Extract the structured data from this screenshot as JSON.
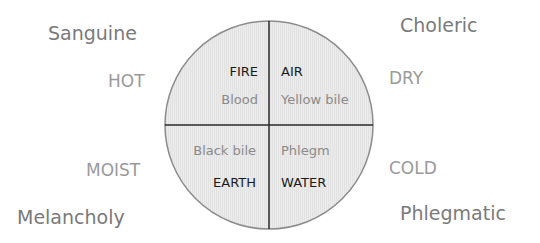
{
  "temperaments": {
    "top_left": "Sanguine",
    "top_right": "Choleric",
    "bottom_left": "Melancholy",
    "bottom_right": "Phlegmatic"
  },
  "qualities": {
    "upper_left": "HOT",
    "upper_right": "DRY",
    "lower_left": "MOIST",
    "lower_right": "COLD"
  },
  "quadrants": {
    "top_left": {
      "element": "FIRE",
      "humor": "Blood"
    },
    "top_right": {
      "element": "AIR",
      "humor": "Yellow bile"
    },
    "bottom_left": {
      "element": "EARTH",
      "humor": "Black bile"
    },
    "bottom_right": {
      "element": "WATER",
      "humor": "Phlegm"
    }
  },
  "colors": {
    "circle_fill": "#ebebeb",
    "circle_stroke": "#8c8c8c",
    "divider": "#2a2a2a",
    "element_text": "#1a1a1a",
    "humor_text": "#8a8a8a",
    "outer_text": "#7a7a7a"
  }
}
